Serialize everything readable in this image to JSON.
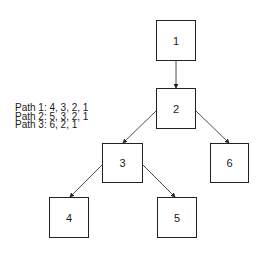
{
  "diagram": {
    "nodes": [
      {
        "id": "1",
        "label": "1",
        "x": 156,
        "y": 20,
        "w": 40,
        "h": 41
      },
      {
        "id": "2",
        "label": "2",
        "x": 156,
        "y": 88,
        "w": 40,
        "h": 41
      },
      {
        "id": "3",
        "label": "3",
        "x": 102,
        "y": 143,
        "w": 41,
        "h": 40
      },
      {
        "id": "6",
        "label": "6",
        "x": 210,
        "y": 143,
        "w": 39,
        "h": 40
      },
      {
        "id": "4",
        "label": "4",
        "x": 49,
        "y": 197,
        "w": 40,
        "h": 41
      },
      {
        "id": "5",
        "label": "5",
        "x": 157,
        "y": 197,
        "w": 40,
        "h": 41
      }
    ],
    "edges": [
      {
        "from": "1",
        "to": "2"
      },
      {
        "from": "2",
        "to": "3"
      },
      {
        "from": "2",
        "to": "6"
      },
      {
        "from": "3",
        "to": "4"
      },
      {
        "from": "3",
        "to": "5"
      }
    ],
    "legend": [
      "Path 1: 4, 3, 2, 1",
      "Path 2: 5, 3, 2, 1",
      "Path 3: 6, 2, 1"
    ]
  }
}
